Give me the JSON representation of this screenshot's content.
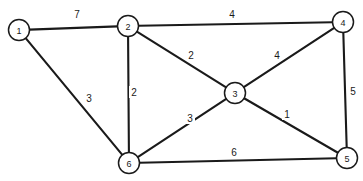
{
  "figure": {
    "kind": "weighted-undirected-graph",
    "background_color": "#ffffff",
    "stroke_color": "#1a1a1a",
    "node_fill_color": "#ffffff",
    "width": 363,
    "height": 181
  },
  "graph": {
    "node_radius": 10.5,
    "nodes": [
      {
        "id": "1",
        "label": "1",
        "x": 19,
        "y": 30
      },
      {
        "id": "2",
        "label": "2",
        "x": 128,
        "y": 26
      },
      {
        "id": "3",
        "label": "3",
        "x": 235,
        "y": 93
      },
      {
        "id": "4",
        "label": "4",
        "x": 343,
        "y": 22
      },
      {
        "id": "5",
        "label": "5",
        "x": 347,
        "y": 158
      },
      {
        "id": "6",
        "label": "6",
        "x": 129,
        "y": 163
      }
    ],
    "edges": [
      {
        "from": "1",
        "to": "2",
        "weight": "7",
        "label_x": 77,
        "label_y": 14
      },
      {
        "from": "2",
        "to": "4",
        "weight": "4",
        "label_x": 232,
        "label_y": 14
      },
      {
        "from": "2",
        "to": "3",
        "weight": "2",
        "label_x": 191,
        "label_y": 55
      },
      {
        "from": "3",
        "to": "4",
        "weight": "4",
        "label_x": 277,
        "label_y": 55
      },
      {
        "from": "4",
        "to": "5",
        "weight": "5",
        "label_x": 353,
        "label_y": 91
      },
      {
        "from": "2",
        "to": "6",
        "weight": "2",
        "label_x": 134,
        "label_y": 92
      },
      {
        "from": "1",
        "to": "6",
        "weight": "3",
        "label_x": 89,
        "label_y": 98
      },
      {
        "from": "3",
        "to": "6",
        "weight": "3",
        "label_x": 190,
        "label_y": 118
      },
      {
        "from": "3",
        "to": "5",
        "weight": "1",
        "label_x": 287,
        "label_y": 114
      },
      {
        "from": "5",
        "to": "6",
        "weight": "6",
        "label_x": 234,
        "label_y": 152
      }
    ]
  }
}
